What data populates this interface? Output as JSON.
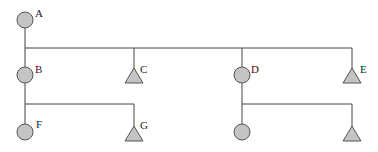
{
  "diagram": {
    "type": "pedigree-tree",
    "colors": {
      "line": "#444444",
      "fill": "#c4c4c4",
      "stroke": "#555555"
    },
    "nodes": [
      {
        "id": "A",
        "label": "A",
        "shape": "circle",
        "x": 25,
        "y": 20
      },
      {
        "id": "B",
        "label": "B",
        "shape": "circle",
        "x": 25,
        "y": 75
      },
      {
        "id": "C",
        "label": "C",
        "shape": "triangle",
        "x": 134,
        "y": 76
      },
      {
        "id": "D",
        "label": "D",
        "shape": "circle",
        "x": 242,
        "y": 75
      },
      {
        "id": "E",
        "label": "E",
        "shape": "triangle",
        "x": 352,
        "y": 76
      },
      {
        "id": "F",
        "label": "F",
        "shape": "circle",
        "x": 25,
        "y": 132
      },
      {
        "id": "G",
        "label": "G",
        "shape": "triangle",
        "x": 134,
        "y": 134
      },
      {
        "id": "H",
        "label": "",
        "shape": "circle",
        "x": 242,
        "y": 132
      },
      {
        "id": "I",
        "label": "",
        "shape": "triangle",
        "x": 352,
        "y": 134
      }
    ],
    "edges": [
      {
        "from": "A",
        "to": [
          "B",
          "C",
          "D",
          "E"
        ]
      },
      {
        "from": "B",
        "to": [
          "F",
          "G"
        ]
      },
      {
        "from": "D",
        "to": [
          "H",
          "I"
        ]
      }
    ]
  }
}
